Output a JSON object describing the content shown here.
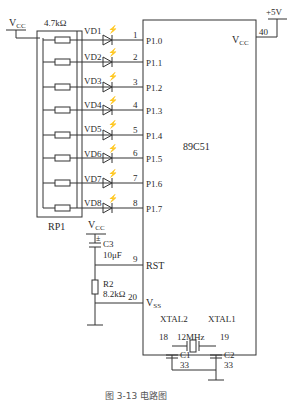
{
  "caption": "图 3-13   电路图",
  "chip": {
    "name": "89C51",
    "vcc_label": "V",
    "vcc_sub": "CC",
    "vss_label": "V",
    "vss_sub": "SS",
    "xtal2": "XTAL2",
    "xtal1": "XTAL1",
    "rst": "RST"
  },
  "power": {
    "plus5v": "+5V",
    "vcc_pin": "40",
    "vcc_top": "V",
    "vcc_top_sub": "CC"
  },
  "resistor_pack": {
    "name": "RP1",
    "value": "4.7kΩ"
  },
  "leds": [
    {
      "name": "VD1",
      "pin": "1",
      "port": "P1.0"
    },
    {
      "name": "VD2",
      "pin": "2",
      "port": "P1.1"
    },
    {
      "name": "VD3",
      "pin": "3",
      "port": "P1.2"
    },
    {
      "name": "VD4",
      "pin": "4",
      "port": "P1.3"
    },
    {
      "name": "VD5",
      "pin": "5",
      "port": "P1.4"
    },
    {
      "name": "VD6",
      "pin": "6",
      "port": "P1.5"
    },
    {
      "name": "VD7",
      "pin": "7",
      "port": "P1.6"
    },
    {
      "name": "VD8",
      "pin": "8",
      "port": "P1.7"
    }
  ],
  "reset": {
    "vcc": "V",
    "vcc_sub": "CC",
    "c3_name": "C3",
    "c3_value": "10μF",
    "r2_name": "R2",
    "r2_value": "8.2kΩ",
    "rst_pin": "9",
    "vss_pin": "20"
  },
  "crystal": {
    "freq": "12MHz",
    "pin18": "18",
    "pin19": "19",
    "c1_name": "C1",
    "c1_value": "33",
    "c2_name": "C2",
    "c2_value": "33"
  }
}
